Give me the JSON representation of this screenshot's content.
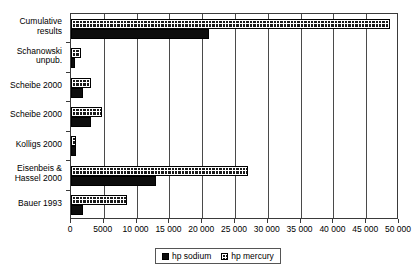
{
  "chart_data": {
    "type": "bar",
    "orientation": "horizontal",
    "title": "",
    "xlabel": "",
    "ylabel": "",
    "xlim": [
      0,
      50000
    ],
    "xticks": [
      0,
      5000,
      10000,
      15000,
      20000,
      25000,
      30000,
      35000,
      40000,
      45000,
      50000
    ],
    "xticklabels": [
      "0",
      "5000",
      "10 000",
      "15 000",
      "20 000",
      "25 000",
      "30 000",
      "35 000",
      "40 000",
      "45 000",
      "50 000"
    ],
    "grid": "vertical",
    "legend_position": "bottom-center",
    "categories": [
      "Cumulative\nresults",
      "Schanowski\nunpub.",
      "Scheibe 2000",
      "Scheibe 2000",
      "Kolligs 2000",
      "Eisenbeis &\nHassel 2000",
      "Bauer 1993"
    ],
    "series": [
      {
        "name": "hp mercury",
        "color": "#1a1a1a",
        "pattern": "cross-hatch-grid",
        "values": [
          48600,
          1500,
          3000,
          4800,
          800,
          27000,
          8500
        ]
      },
      {
        "name": "hp sodium",
        "color": "#0d0d0d",
        "pattern": "solid",
        "values": [
          21000,
          600,
          1900,
          3000,
          700,
          13000,
          1800
        ]
      }
    ]
  },
  "legend": {
    "items": [
      {
        "label": "hp sodium"
      },
      {
        "label": "hp mercury"
      }
    ]
  }
}
